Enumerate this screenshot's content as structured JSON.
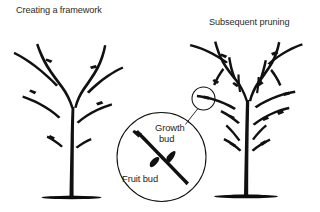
{
  "figure": {
    "background_color": "#ffffff",
    "ink_color": "#111111",
    "text_color": "#2b2b2b",
    "panels": [
      {
        "id": "left-panel",
        "title": "Creating a framework",
        "subject": "young-fruit-tree-open-vase-framework",
        "branch_count": 8,
        "bud_marks": 5
      },
      {
        "id": "right-panel",
        "title": "Subsequent pruning",
        "subject": "mature-fruit-tree-dense-branching",
        "branch_count": 22,
        "bud_marks": 12
      }
    ],
    "callout": {
      "id": "bud-detail-magnifier",
      "shape": "circle",
      "labels": [
        {
          "name": "growth-bud",
          "line1": "Growth",
          "line2": "bud"
        },
        {
          "name": "fruit-bud",
          "line1": "Fruit bud",
          "line2": ""
        }
      ],
      "source_marker": "small-circle-on-right-tree-branch"
    }
  }
}
